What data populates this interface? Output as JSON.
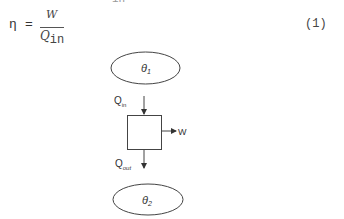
{
  "page_fragment": {
    "clipped_top_text": "in"
  },
  "equation": {
    "lhs": "η",
    "equals": "=",
    "numerator": "W",
    "denominator_base": "Q",
    "denominator_sub": "in",
    "number": "(1)"
  },
  "diagram": {
    "hot_reservoir": {
      "label": "θ",
      "sub": "1"
    },
    "cold_reservoir": {
      "label": "θ",
      "sub": "2"
    },
    "heat_in": {
      "label": "Q",
      "sub": "in"
    },
    "heat_out": {
      "label": "Q",
      "sub": "out"
    },
    "work_out": {
      "label": "W"
    }
  }
}
